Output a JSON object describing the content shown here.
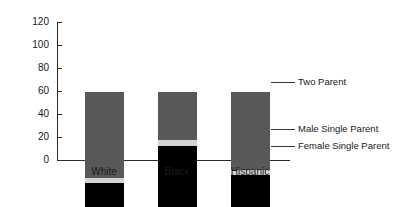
{
  "chart_data": {
    "type": "bar",
    "subtype": "stacked-bar-100",
    "title": "",
    "subtitle": "",
    "xlabel": "2007",
    "ylabel": "",
    "categories": [
      "White",
      "Black",
      "Hispanic"
    ],
    "series": [
      {
        "name": "Female Single Parent",
        "values": [
          21,
          53,
          28
        ],
        "color": "#000000"
      },
      {
        "name": "Male Single Parent",
        "values": [
          4,
          5,
          4
        ],
        "color": "#d4d4d4"
      },
      {
        "name": "Two Parent",
        "values": [
          75,
          42,
          68
        ],
        "color": "#58585a"
      }
    ],
    "ylim": [
      0,
      120
    ],
    "yticks": [
      0,
      20,
      40,
      60,
      80,
      100,
      120
    ],
    "ytick_labels": [
      "0",
      "20",
      "40",
      "60",
      "80",
      "100",
      "120"
    ],
    "grid": false,
    "legend_position": "right-callout",
    "stack_total": 100
  },
  "axis": {
    "y_tick_labels": [
      "120",
      "100",
      "80",
      "60",
      "40",
      "20",
      "0"
    ]
  },
  "categories": {
    "items": [
      {
        "label": "White"
      },
      {
        "label": "Black"
      },
      {
        "label": "Hispanic"
      }
    ],
    "period": "2007"
  },
  "legend": {
    "items": [
      {
        "label": "Two Parent"
      },
      {
        "label": "Male Single Parent"
      },
      {
        "label": "Female Single Parent"
      }
    ]
  }
}
